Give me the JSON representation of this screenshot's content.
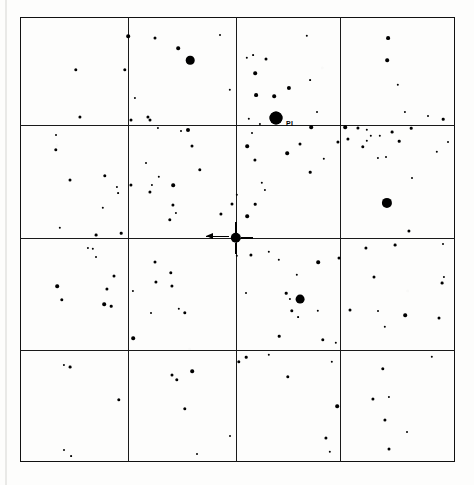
{
  "chart": {
    "type": "star-finder-chart",
    "title": "",
    "frame": {
      "x": 20,
      "y": 17,
      "width": 435,
      "height": 445
    },
    "grid": {
      "columns": 4,
      "rows": 4,
      "vertical_lines": [
        128,
        236,
        340
      ],
      "horizontal_lines": [
        125,
        238,
        350
      ],
      "color": "#1a1a1a"
    },
    "background_color": "#fdfdfc",
    "ink_color": "#000000"
  },
  "labels": [
    {
      "text": "PI",
      "x": 286,
      "y": 123,
      "size": 7
    }
  ],
  "center_target": {
    "x": 236,
    "y": 238,
    "radius": 5.2,
    "has_crosshair_ticks": true,
    "arrow": {
      "from_x": 206,
      "to_x": 229,
      "y": 236
    }
  },
  "chart_data": {
    "type": "scatter",
    "xlabel": "",
    "ylabel": "",
    "xlim": [
      20,
      455
    ],
    "ylim": [
      17,
      462
    ],
    "grid": true,
    "legend": "none",
    "series": [
      {
        "name": "field stars",
        "points": [
          [
            76,
            70,
            1.7
          ],
          [
            125,
            70,
            1.7
          ],
          [
            135,
            98,
            1.1
          ],
          [
            80,
            117,
            1.6
          ],
          [
            128,
            36,
            1.8
          ],
          [
            131,
            120,
            1.5
          ],
          [
            178,
            48,
            1.8
          ],
          [
            190,
            60,
            4.3
          ],
          [
            150,
            120,
            1.5
          ],
          [
            230,
            90,
            1.2
          ],
          [
            148,
            117,
            1.6
          ],
          [
            155,
            38,
            1.5
          ],
          [
            220,
            35,
            1.0
          ],
          [
            247,
            58,
            1.2
          ],
          [
            266,
            59,
            1.5
          ],
          [
            253,
            55,
            0.9
          ],
          [
            255,
            73,
            1.8
          ],
          [
            289,
            88,
            2.1
          ],
          [
            256,
            95,
            1.9
          ],
          [
            274,
            96,
            1.8
          ],
          [
            310,
            80,
            0.9
          ],
          [
            311,
            127,
            1.8
          ],
          [
            249,
            119,
            1.2
          ],
          [
            252,
            133,
            1.0
          ],
          [
            260,
            124,
            1.1
          ],
          [
            276,
            118,
            6.5
          ],
          [
            307,
            36,
            1.2
          ],
          [
            317,
            112,
            1.0
          ],
          [
            388,
            38,
            1.9
          ],
          [
            387,
            60,
            1.8
          ],
          [
            398,
            85,
            1.2
          ],
          [
            345,
            127,
            1.8
          ],
          [
            358,
            128,
            1.6
          ],
          [
            367,
            130,
            1.2
          ],
          [
            371,
            136,
            1.2
          ],
          [
            405,
            112,
            1.1
          ],
          [
            428,
            116,
            1.0
          ],
          [
            443,
            119,
            1.3
          ],
          [
            56,
            150,
            1.7
          ],
          [
            70,
            180,
            1.5
          ],
          [
            105,
            176,
            1.7
          ],
          [
            103,
            208,
            1.2
          ],
          [
            60,
            228,
            1.2
          ],
          [
            96,
            235,
            1.4
          ],
          [
            56,
            135,
            1.0
          ],
          [
            117,
            187,
            1.1
          ],
          [
            118,
            193,
            0.9
          ],
          [
            121,
            233,
            1.3
          ],
          [
            188,
            130,
            2.0
          ],
          [
            192,
            146,
            1.5
          ],
          [
            200,
            170,
            1.7
          ],
          [
            152,
            185,
            1.1
          ],
          [
            150,
            192,
            1.6
          ],
          [
            173,
            185,
            1.8
          ],
          [
            173,
            205,
            1.6
          ],
          [
            176,
            213,
            1.1
          ],
          [
            170,
            220,
            1.7
          ],
          [
            181,
            131,
            1.0
          ],
          [
            159,
            177,
            1.2
          ],
          [
            146,
            163,
            1.0
          ],
          [
            158,
            128,
            1.1
          ],
          [
            131,
            185,
            1.6
          ],
          [
            247,
            146,
            1.8
          ],
          [
            255,
            160,
            1.6
          ],
          [
            237,
            195,
            1.2
          ],
          [
            262,
            183,
            1.2
          ],
          [
            265,
            190,
            1.1
          ],
          [
            255,
            204,
            1.3
          ],
          [
            287,
            153,
            1.8
          ],
          [
            300,
            144,
            1.5
          ],
          [
            310,
            172,
            1.3
          ],
          [
            338,
            142,
            1.6
          ],
          [
            324,
            159,
            1.2
          ],
          [
            232,
            204,
            1.5
          ],
          [
            247,
            216,
            1.8
          ],
          [
            221,
            214,
            1.6
          ],
          [
            363,
            147,
            1.7
          ],
          [
            367,
            141,
            1.2
          ],
          [
            348,
            139,
            1.6
          ],
          [
            380,
            136,
            1.2
          ],
          [
            378,
            158,
            1.1
          ],
          [
            386,
            157,
            1.0
          ],
          [
            392,
            132,
            1.4
          ],
          [
            399,
            141,
            1.3
          ],
          [
            411,
            128,
            1.3
          ],
          [
            387,
            203,
            5.1
          ],
          [
            409,
            231,
            1.6
          ],
          [
            412,
            178,
            1.0
          ],
          [
            437,
            152,
            1.2
          ],
          [
            448,
            142,
            1.0
          ],
          [
            57,
            286,
            1.8
          ],
          [
            62,
            300,
            1.7
          ],
          [
            93,
            249,
            1.2
          ],
          [
            88,
            248,
            1.1
          ],
          [
            96,
            257,
            1.0
          ],
          [
            114,
            276,
            1.5
          ],
          [
            107,
            289,
            1.6
          ],
          [
            104,
            304,
            1.8
          ],
          [
            111,
            306,
            1.3
          ],
          [
            133,
            291,
            1.1
          ],
          [
            156,
            282,
            1.6
          ],
          [
            172,
            286,
            1.6
          ],
          [
            171,
            273,
            1.7
          ],
          [
            155,
            262,
            1.5
          ],
          [
            179,
            309,
            1.2
          ],
          [
            133,
            338,
            1.8
          ],
          [
            185,
            313,
            1.7
          ],
          [
            151,
            313,
            1.0
          ],
          [
            237,
            256,
            1.2
          ],
          [
            251,
            255,
            1.6
          ],
          [
            269,
            252,
            1.2
          ],
          [
            279,
            260,
            1.2
          ],
          [
            318,
            262,
            1.8
          ],
          [
            339,
            258,
            1.5
          ],
          [
            297,
            275,
            1.2
          ],
          [
            286,
            293,
            1.3
          ],
          [
            290,
            299,
            1.1
          ],
          [
            300,
            299,
            4.4
          ],
          [
            292,
            311,
            1.7
          ],
          [
            298,
            317,
            0.9
          ],
          [
            318,
            311,
            1.2
          ],
          [
            279,
            336,
            1.3
          ],
          [
            323,
            340,
            1.7
          ],
          [
            336,
            343,
            1.2
          ],
          [
            246,
            293,
            1.0
          ],
          [
            366,
            248,
            1.6
          ],
          [
            395,
            245,
            1.4
          ],
          [
            374,
            277,
            1.5
          ],
          [
            350,
            310,
            1.5
          ],
          [
            378,
            311,
            1.0
          ],
          [
            405,
            315,
            1.8
          ],
          [
            442,
            283,
            1.4
          ],
          [
            444,
            277,
            1.1
          ],
          [
            439,
            318,
            1.5
          ],
          [
            385,
            327,
            1.2
          ],
          [
            443,
            244,
            1.0
          ],
          [
            64,
            365,
            1.1
          ],
          [
            70,
            367,
            1.4
          ],
          [
            119,
            400,
            1.7
          ],
          [
            64,
            450,
            1.0
          ],
          [
            71,
            456,
            0.9
          ],
          [
            177,
            380,
            1.7
          ],
          [
            172,
            375,
            1.5
          ],
          [
            192,
            371,
            1.8
          ],
          [
            185,
            409,
            1.7
          ],
          [
            230,
            436,
            1.0
          ],
          [
            197,
            454,
            1.0
          ],
          [
            239,
            362,
            1.7
          ],
          [
            246,
            357,
            1.3
          ],
          [
            269,
            355,
            1.2
          ],
          [
            288,
            377,
            1.7
          ],
          [
            337,
            406,
            1.8
          ],
          [
            332,
            362,
            1.2
          ],
          [
            326,
            438,
            1.6
          ],
          [
            330,
            452,
            1.2
          ],
          [
            383,
            369,
            1.7
          ],
          [
            373,
            399,
            1.6
          ],
          [
            389,
            397,
            1.1
          ],
          [
            385,
            420,
            1.6
          ],
          [
            407,
            432,
            1.0
          ],
          [
            389,
            449,
            1.5
          ],
          [
            432,
            357,
            1.2
          ]
        ],
        "point_format": "[x_px, y_px, radius_px]"
      },
      {
        "name": "named star",
        "points": [
          [
            276,
            118,
            6.5
          ]
        ],
        "label": "PI"
      },
      {
        "name": "target star",
        "points": [
          [
            236,
            238,
            5.2
          ]
        ],
        "label": ""
      }
    ]
  }
}
